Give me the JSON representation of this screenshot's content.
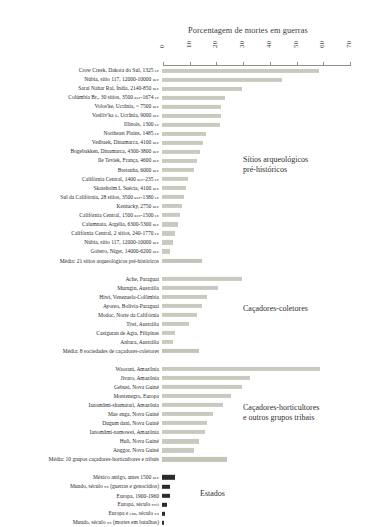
{
  "chart_data": {
    "type": "bar",
    "title": "Porcentagem de mortes em guerras",
    "xlabel": "",
    "ylabel": "",
    "xlim": [
      0,
      70
    ],
    "xticks": [
      0,
      10,
      20,
      30,
      40,
      50,
      60,
      70
    ],
    "grid": false,
    "orientation": "horizontal",
    "groups": [
      {
        "name": "Sítios arqueológicos pré-históricos",
        "note": "Sítios arqueológicos\npré-históricos",
        "color": "#c9cabf",
        "categories": [
          "Crow Creek, Dakota do Sul, 1325 EC",
          "Núbia, sítio 117, 12000-10000 AEC",
          "Sarai Nahar Rai, Índia, 2140-850 AEC",
          "Colúmbia Br., 30 sítios, 3500 AEC-1674 EC",
          "Volos'ke, Ucrânia, ~ 7500 AEC",
          "Vasiliv'ka II, Ucrânia, 9000 AEC",
          "Illinois, 1300 EC",
          "Northeast Plains, 1485 EC",
          "Vedbaek, Dinamarca, 4100 AEC",
          "Bogebakken, Dinamarca, 4300-3800 AEC",
          "Ile Teviek, França, 4600 AEC",
          "Bretanha, 6000 AEC",
          "Califórnia Central, 1400 AEC-235 EC",
          "Skateholm I, Suécia, 4100 AEC",
          "Sul da Califórnia, 28 sítios, 3500 AEC-1380 EC",
          "Kentucky, 2750 AEC",
          "Califórnia Central, 1500 AEC-1500 EC",
          "Calumnata, Argélia, 6300-5300 AEC",
          "Califórnia Central, 2 sítios, 240-1770 EC",
          "Núbia, sítio 117, 12000-10000 AEC",
          "Gobero, Níger, 14000-6200 AEC",
          "Média: 21 sítios arqueológicos pré-históricos"
        ],
        "values": [
          58.8,
          45.0,
          30.0,
          23.5,
          22.2,
          22.0,
          21.8,
          16.3,
          15.4,
          14.1,
          13.1,
          11.8,
          9.6,
          8.8,
          8.2,
          7.4,
          6.6,
          6.0,
          5.0,
          4.2,
          3.0,
          15.1
        ]
      },
      {
        "name": "Caçadores-coletores",
        "note": "Caçadores-coletores",
        "color": "#c9cabf",
        "categories": [
          "Ache, Paraguai",
          "Murngin, Austrália",
          "Hiwi, Venezuela-Colômbia",
          "Ayoreo, Bolívia-Paraguai",
          "Modoc, Norte da Califórnia",
          "Tiwi, Austrália",
          "Casiguran de Agta, Filipinas",
          "Anbara, Austrália",
          "Média: 8 sociedades de caçadores-coletores"
        ],
        "values": [
          30.0,
          21.0,
          17.0,
          15.0,
          13.0,
          10.0,
          5.0,
          4.0,
          14.0
        ]
      },
      {
        "name": "Caçadores-horticultores e outros grupos tribais",
        "note": "Caçadores-horticultores\ne outros grupos tribais",
        "color": "#c9cabf",
        "categories": [
          "Waorani, Amazônia",
          "Jívaro, Amazônia",
          "Gebusi, Nova Guiné",
          "Montenegro, Europa",
          "Ianomâmi-shamatari, Amazônia",
          "Mae enga, Nova Guiné",
          "Dugum dani, Nova Guiné",
          "Ianomâmi-namowei, Amazônia",
          "Huli, Nova Guiné",
          "Anggor, Nova Guiné",
          "Média: 10 grupos caçadores-horticultores e tribais"
        ],
        "values": [
          59.0,
          33.0,
          30.0,
          26.0,
          23.0,
          19.0,
          17.0,
          16.0,
          14.0,
          12.0,
          24.5
        ]
      },
      {
        "name": "Estados",
        "note": "Estados",
        "color": "#2b2b2b",
        "categories": [
          "México antigo, antes 1500 AEC",
          "Mundo, século XX (guerras e genocídios)",
          "Europa, 1900-1960",
          "Europa, século XVII",
          "Europa e EUA, século XX",
          "Mundo, século XX (mortes em batalhas)"
        ],
        "values": [
          5.0,
          3.0,
          3.0,
          2.0,
          1.0,
          0.7
        ]
      }
    ]
  }
}
